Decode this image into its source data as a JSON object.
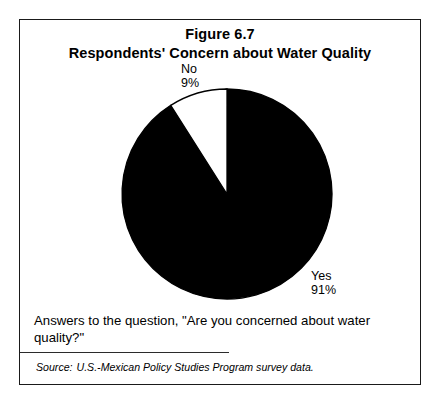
{
  "figure": {
    "title_line1": "Figure 6.7",
    "title_line2": "Respondents' Concern about Water Quality",
    "caption": "Answers to the question, \"Are you concerned about water quality?\"",
    "source_label": "Source:",
    "source_text": "U.S.-Mexican Policy Studies Program survey data."
  },
  "labels": {
    "no_name": "No",
    "no_pct": "9%",
    "yes_name": "Yes",
    "yes_pct": "91%"
  },
  "colors": {
    "yes_fill": "#000000",
    "no_fill": "#ffffff",
    "outline": "#000000",
    "frame": "#1a1a1a",
    "text": "#000000"
  },
  "chart_data": {
    "type": "pie",
    "title": "Respondents' Concern about Water Quality",
    "categories": [
      "Yes",
      "No"
    ],
    "values": [
      91,
      9
    ],
    "value_labels": [
      "91%",
      "9%"
    ],
    "unit": "percent",
    "start_angle_deg": 90,
    "direction": "counterclockwise",
    "slice_colors": [
      "#000000",
      "#ffffff"
    ],
    "legend": "none",
    "annotations": [
      "No 9%",
      "Yes 91%"
    ],
    "xlabel": "",
    "ylabel": ""
  }
}
